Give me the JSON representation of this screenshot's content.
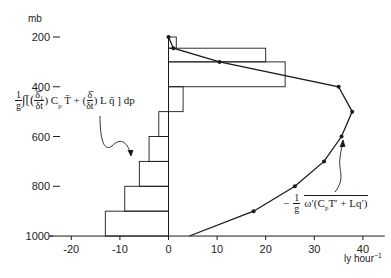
{
  "chart_data": {
    "type": "bar+line",
    "title": "",
    "xlabel": "ly hour⁻¹",
    "ylabel": "mb",
    "xlim": [
      -25,
      45
    ],
    "ylim": [
      1000,
      170
    ],
    "x_ticks": [
      -20,
      -10,
      0,
      10,
      20,
      30,
      40
    ],
    "x_tick_labels": [
      "-20",
      "-10",
      "0",
      "10",
      "20",
      "30",
      "40"
    ],
    "y_ticks": [
      200,
      400,
      600,
      800,
      1000
    ],
    "y_tick_labels": [
      "200",
      "400",
      "600",
      "800",
      "1000"
    ],
    "grid": false,
    "series": [
      {
        "name": "(1/g)∫[(δ₁/δt)CpT̄ + (δ̄/δt)Lq̄]dp",
        "type": "step-bar",
        "bars": [
          {
            "p_top": 200,
            "p_bottom": 245,
            "value": 1.6
          },
          {
            "p_top": 245,
            "p_bottom": 300,
            "value": 20
          },
          {
            "p_top": 300,
            "p_bottom": 400,
            "value": 24
          },
          {
            "p_top": 400,
            "p_bottom": 500,
            "value": 3
          },
          {
            "p_top": 500,
            "p_bottom": 600,
            "value": -2
          },
          {
            "p_top": 600,
            "p_bottom": 700,
            "value": -4
          },
          {
            "p_top": 700,
            "p_bottom": 800,
            "value": -6
          },
          {
            "p_top": 800,
            "p_bottom": 900,
            "value": -9
          },
          {
            "p_top": 900,
            "p_bottom": 1000,
            "value": -13
          }
        ]
      },
      {
        "name": "-(1/g) ω'(CpT' + Lq') (overbar)",
        "type": "line",
        "points": [
          {
            "p": 200,
            "value": 0
          },
          {
            "p": 245,
            "value": 1
          },
          {
            "p": 300,
            "value": 10.5
          },
          {
            "p": 400,
            "value": 35
          },
          {
            "p": 500,
            "value": 37.8
          },
          {
            "p": 600,
            "value": 35.6
          },
          {
            "p": 700,
            "value": 32
          },
          {
            "p": 800,
            "value": 26
          },
          {
            "p": 900,
            "value": 17.5
          },
          {
            "p": 1000,
            "value": 4.3
          }
        ],
        "markers_at": [
          200,
          245,
          300,
          400,
          500,
          600,
          700,
          800,
          900
        ]
      }
    ],
    "annotations": [
      {
        "text": "1/g ∫[(δ₁/δt) Cp T̄ + (δ̄/δt) L q̄] dp",
        "points_to": "step-bar"
      },
      {
        "text": "− 1/g ω'(Cp T' + L q')",
        "points_to": "line"
      }
    ]
  },
  "labels": {
    "y_unit": "mb",
    "x_unit": "ly hour",
    "x_unit_exp": "−1",
    "formula_left": {
      "one": "1",
      "g": "g",
      "integral": "∫",
      "open": "[(",
      "d1_num": "δ̄₁",
      "d1_den": "δt",
      "mid1": ") C",
      "sub_p": "p",
      "tbar": " T̄ + (",
      "d2_num": "δ̄",
      "d2_den": "δt",
      "mid2": ") L q̄ ] dp"
    },
    "formula_right": {
      "minus": "−",
      "one": "1",
      "g": "g",
      "body": "ω′(C",
      "sub_p": "p",
      "rest": "T′ + Lq′)"
    }
  }
}
